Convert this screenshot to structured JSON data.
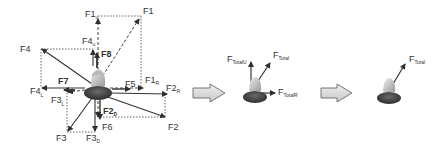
{
  "diagram": {
    "type": "force-vector-decomposition",
    "colors": {
      "vector": "#3a3a3a",
      "dashed": "#555555",
      "arrow_fill": "#d8d8d8",
      "arrow_stroke": "#777777",
      "person_body": "#4a4a4a",
      "person_head": "#d9d9d9"
    },
    "panel1": {
      "labels": {
        "F1_top": "F1",
        "F1_top_sub": "u",
        "F1": "F1",
        "F4": "F4",
        "F4u": "F4",
        "F4u_sub": "u",
        "F8": "F8",
        "F7": "F7",
        "F5": "F5",
        "F1r": "F1",
        "F1r_sub": "R",
        "F2r": "F2",
        "F2r_sub": "R",
        "F4l": "F4",
        "F4l_sub": "L",
        "F3l": "F3",
        "F3l_sub": "L",
        "F2d": "F2",
        "F2d_sub": "D",
        "F6": "F6",
        "F2": "F2",
        "F3": "F3",
        "F3d": "F3",
        "F3d_sub": "D"
      }
    },
    "panel2": {
      "labels": {
        "ftu": "F",
        "ftu_sub": "TotalU",
        "ft": "F",
        "ft_sub": "Total",
        "ftr": "F",
        "ftr_sub": "TotalR"
      }
    },
    "panel3": {
      "labels": {
        "ft": "F",
        "ft_sub": "Total"
      }
    },
    "transition_arrows": [
      "arrow-1-to-2",
      "arrow-2-to-3"
    ]
  }
}
